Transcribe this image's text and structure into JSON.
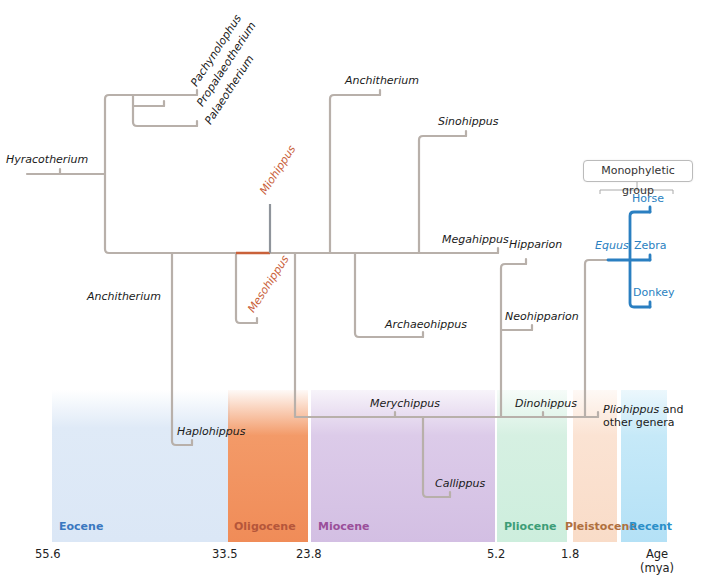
{
  "colors": {
    "branch": "#b8b0aa",
    "highlight_red": "#c9613a",
    "miohippus_stem": "#8f949b",
    "equus_blue": "#2a7fc1"
  },
  "taxa": {
    "hyracotherium": "Hyracotherium",
    "pachynolophus": "Pachynolophus",
    "propalaeotherium": "Propalaeotherium",
    "palaeotherium": "Palaeotherium",
    "miohippus": "Miohippus",
    "mesohippus": "Mesohippus",
    "anchitherium_lower": "Anchitherium",
    "haplohippus": "Haplohippus",
    "anchitherium_upper": "Anchitherium",
    "sinohippus": "Sinohippus",
    "megahippus": "Megahippus",
    "archaeohippus": "Archaeohippus",
    "hipparion": "Hipparion",
    "neohipparion": "Neohipparion",
    "merychippus": "Merychippus",
    "callippus": "Callippus",
    "dinohippus": "Dinohippus",
    "pliohippus": "Pliohippus",
    "pliohippus_suffix": " and",
    "other_genera": "other genera",
    "equus": "Equus",
    "horse": "Horse",
    "zebra": "Zebra",
    "donkey": "Donkey"
  },
  "monophyletic_group": "Monophyletic group",
  "epochs": [
    {
      "name": "Eocene",
      "color": "#3a78c0",
      "band": "#dbe8f6"
    },
    {
      "name": "Oligocene",
      "color": "#b5563a",
      "band": "#f2925f"
    },
    {
      "name": "Miocene",
      "color": "#9a4f9a",
      "band": "#d8c6e6"
    },
    {
      "name": "Pliocene",
      "color": "#3d9d77",
      "band": "#d2efdf"
    },
    {
      "name": "Pleistocene",
      "color": "#b0703f",
      "band": "#fbe1cf"
    },
    {
      "name": "Recent",
      "color": "#2a8fc8",
      "band": "#bfe6f7"
    }
  ],
  "ages": [
    "55.6",
    "33.5",
    "23.8",
    "5.2",
    "1.8"
  ],
  "age_axis": {
    "label": "Age",
    "unit": "(mya)"
  }
}
